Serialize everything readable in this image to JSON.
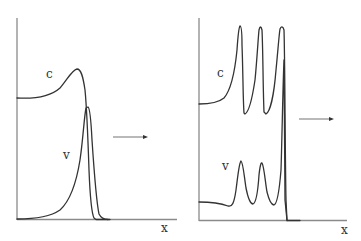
{
  "figure": {
    "panels": [
      {
        "id": "left",
        "curve_labels": {
          "c": "c",
          "v": "v"
        },
        "x_axis_label": "x",
        "arrow_direction": "right",
        "description": "Single pulse: c has a smooth hump with peak, v a sharp pulse slightly ahead"
      },
      {
        "id": "right",
        "curve_labels": {
          "c": "c",
          "v": "v"
        },
        "x_axis_label": "x",
        "arrow_direction": "right",
        "description": "Oscillatory wave train: c and v show three spikes each"
      }
    ],
    "colors": {
      "curve": "#333333",
      "axis": "#8a8a8a",
      "background": "#ffffff"
    }
  }
}
